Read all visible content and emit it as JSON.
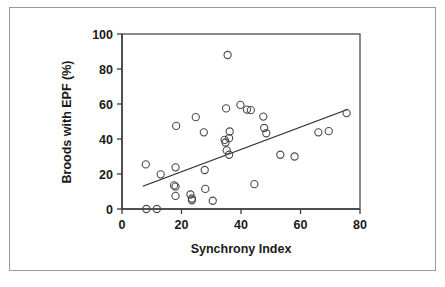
{
  "chart_data": {
    "type": "scatter",
    "title": "",
    "xlabel": "Synchrony Index",
    "ylabel": "Broods with EPF  (%)",
    "xlim": [
      0,
      80
    ],
    "ylim": [
      0,
      100
    ],
    "xticks": [
      0,
      20,
      40,
      60,
      80
    ],
    "yticks": [
      0,
      20,
      40,
      60,
      80,
      100
    ],
    "xtick_labels": [
      "0",
      "20",
      "40",
      "60",
      "80"
    ],
    "ytick_labels": [
      "0",
      "20",
      "40",
      "60",
      "80",
      "100"
    ],
    "grid": false,
    "legend": null,
    "marker": "open-circle",
    "marker_color": "#4a4a4a",
    "series": [
      {
        "name": "Broods with EPF vs Synchrony Index",
        "points": [
          [
            8.0,
            25.5
          ],
          [
            8.2,
            0.0
          ],
          [
            11.7,
            0.0
          ],
          [
            13.0,
            19.8
          ],
          [
            17.5,
            13.5
          ],
          [
            18.0,
            23.8
          ],
          [
            18.2,
            47.5
          ],
          [
            18.0,
            12.8
          ],
          [
            18.0,
            7.5
          ],
          [
            23.0,
            8.3
          ],
          [
            23.5,
            6.0
          ],
          [
            23.5,
            5.0
          ],
          [
            24.8,
            52.5
          ],
          [
            27.5,
            43.8
          ],
          [
            27.8,
            22.3
          ],
          [
            28.0,
            11.5
          ],
          [
            30.5,
            4.7
          ],
          [
            34.5,
            39.5
          ],
          [
            34.8,
            38.0
          ],
          [
            35.0,
            57.5
          ],
          [
            35.2,
            33.5
          ],
          [
            35.5,
            88.0
          ],
          [
            36.0,
            40.5
          ],
          [
            36.2,
            44.3
          ],
          [
            36.0,
            31.0
          ],
          [
            39.8,
            59.5
          ],
          [
            42.0,
            56.8
          ],
          [
            43.3,
            56.5
          ],
          [
            44.5,
            14.2
          ],
          [
            47.5,
            52.8
          ],
          [
            47.8,
            46.3
          ],
          [
            48.5,
            43.3
          ],
          [
            53.2,
            31.0
          ],
          [
            58.0,
            30.0
          ],
          [
            66.0,
            43.8
          ],
          [
            69.5,
            44.5
          ],
          [
            75.5,
            54.8
          ]
        ]
      }
    ],
    "trend_line": {
      "x_start": 7.0,
      "y_start": 13.0,
      "x_end": 76.0,
      "y_end": 57.0
    }
  },
  "axis": {
    "x_title": "Synchrony Index",
    "y_title": "Broods with EPF  (%)"
  }
}
